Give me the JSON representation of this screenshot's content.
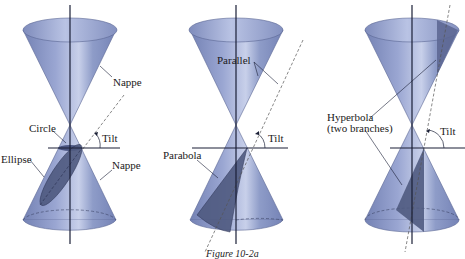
{
  "figure": {
    "caption": "Figure 10-2a",
    "colors": {
      "cone_fill": "#8a98c6",
      "cone_dark": "#6a78a8",
      "section_fill": "#4f5a80",
      "axis": "#1a1f36",
      "background": "#ffffff"
    },
    "panels": [
      {
        "id": "ellipse-circle",
        "labels": {
          "nappe_top": "Nappe",
          "circle": "Circle",
          "tilt": "Tilt",
          "ellipse": "Ellipse",
          "nappe_bottom": "Nappe"
        }
      },
      {
        "id": "parabola",
        "labels": {
          "parallel": "Parallel",
          "tilt": "Tilt",
          "parabola": "Parabola"
        }
      },
      {
        "id": "hyperbola",
        "labels": {
          "hyperbola_line1": "Hyperbola",
          "hyperbola_line2": "(two branches)",
          "tilt": "Tilt"
        }
      }
    ]
  }
}
